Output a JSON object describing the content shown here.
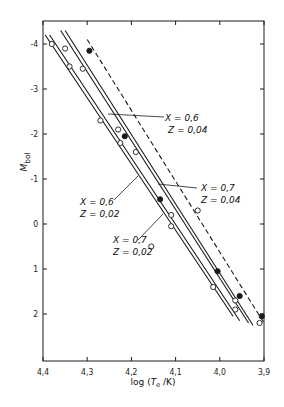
{
  "chart_data": {
    "type": "line",
    "title": "",
    "xlabel": "log (Te / K)",
    "xlabel_parts": {
      "pre": "log (",
      "var": "T",
      "sub": "e",
      "post": " /K)"
    },
    "ylabel": "Mbol",
    "ylabel_parts": {
      "var": "M",
      "sub": "bol"
    },
    "xlim": [
      4.4,
      3.9
    ],
    "ylim": [
      -4.4,
      2.8
    ],
    "x_inverted": true,
    "y_inverted": true,
    "xticks": [
      4.4,
      4.3,
      4.2,
      4.1,
      4.0,
      3.9
    ],
    "xtick_labels": [
      "4,4",
      "4,3",
      "4,2",
      "4,1",
      "4,0",
      "3,9"
    ],
    "yticks": [
      -4,
      -3,
      -2,
      -1,
      0,
      1,
      2
    ],
    "ytick_labels": [
      "-4",
      "-3",
      "-2",
      "-1",
      "0",
      "1",
      "2"
    ],
    "grid": false,
    "series": [
      {
        "name": "X = 0,6, Z = 0,02",
        "style": "solid",
        "x": [
          4.395,
          3.97
        ],
        "y": [
          -4.2,
          2.05
        ]
      },
      {
        "name": "X = 0,7, Z = 0,02",
        "style": "solid",
        "x": [
          4.385,
          3.955
        ],
        "y": [
          -4.2,
          2.15
        ]
      },
      {
        "name": "X = 0,6, Z = 0,04",
        "style": "solid",
        "x": [
          4.36,
          3.935
        ],
        "y": [
          -4.3,
          2.2
        ]
      },
      {
        "name": "X = 0,7, Z = 0,04",
        "style": "solid",
        "x": [
          4.35,
          3.925
        ],
        "y": [
          -4.3,
          2.25
        ]
      },
      {
        "name": "observed trend",
        "style": "dashed",
        "x": [
          4.3,
          3.9
        ],
        "y": [
          -4.1,
          2.2
        ]
      }
    ],
    "points_open": [
      {
        "x": 4.38,
        "y": -4.0
      },
      {
        "x": 4.35,
        "y": -3.9
      },
      {
        "x": 4.34,
        "y": -3.5
      },
      {
        "x": 4.31,
        "y": -3.45
      },
      {
        "x": 4.27,
        "y": -2.3
      },
      {
        "x": 4.23,
        "y": -2.1
      },
      {
        "x": 4.225,
        "y": -1.8
      },
      {
        "x": 4.19,
        "y": -1.6
      },
      {
        "x": 4.155,
        "y": 0.5
      },
      {
        "x": 4.11,
        "y": -0.2
      },
      {
        "x": 4.11,
        "y": 0.05
      },
      {
        "x": 4.05,
        "y": -0.3
      },
      {
        "x": 4.015,
        "y": 1.4
      },
      {
        "x": 3.965,
        "y": 1.7
      },
      {
        "x": 3.965,
        "y": 1.9
      },
      {
        "x": 3.91,
        "y": 2.2
      }
    ],
    "points_filled": [
      {
        "x": 4.295,
        "y": -3.85
      },
      {
        "x": 4.215,
        "y": -1.95
      },
      {
        "x": 4.135,
        "y": -0.55
      },
      {
        "x": 4.005,
        "y": 1.05
      },
      {
        "x": 3.955,
        "y": 1.6
      },
      {
        "x": 3.905,
        "y": 2.05
      }
    ],
    "annotations": [
      {
        "text_x": "X = 0,6",
        "text_z": "Z = 0,04"
      },
      {
        "text_x": "X = 0,7",
        "text_z": "Z = 0,04"
      },
      {
        "text_x": "X = 0,6",
        "text_z": "Z = 0,02"
      },
      {
        "text_x": "X = 0,7",
        "text_z": "Z = 0,02"
      }
    ]
  },
  "labels": {
    "a1x": "X = 0,6",
    "a1z": "Z = 0,04",
    "a2x": "X = 0,7",
    "a2z": "Z = 0,04",
    "a3x": "X = 0,6",
    "a3z": "Z = 0,02",
    "a4x": "X = 0,7",
    "a4z": "Z = 0,02"
  },
  "colors": {
    "ink": "#1a1a1a",
    "background": "#ffffff"
  }
}
